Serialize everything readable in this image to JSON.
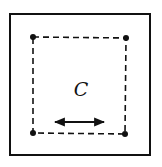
{
  "diagram": {
    "label": "C",
    "colors": {
      "stroke": "#111111",
      "background": "#ffffff"
    },
    "elements": {
      "outer_box": "solid square frame",
      "inner_box": "dashed square boundary",
      "corner_points": [
        "top-left",
        "top-right",
        "bottom-left",
        "bottom-right"
      ],
      "arrow": "double-headed horizontal arrow"
    }
  }
}
